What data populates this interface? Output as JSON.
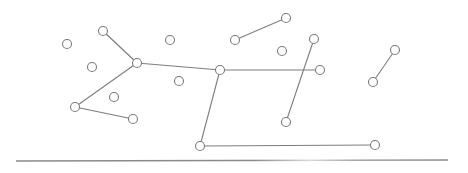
{
  "diagram": {
    "type": "graph",
    "width": 468,
    "height": 173,
    "colors": {
      "background": "#ffffff",
      "edge": "#7d7d7d",
      "node_stroke": "#7a7a7a",
      "node_fill": "#ffffff",
      "baseline": "#8a8a8a"
    },
    "node_radius": 4.5,
    "nodes": [
      {
        "id": "n1",
        "x": 67,
        "y": 44
      },
      {
        "id": "n2",
        "x": 103,
        "y": 31
      },
      {
        "id": "n3",
        "x": 137,
        "y": 63
      },
      {
        "id": "n4",
        "x": 92,
        "y": 67
      },
      {
        "id": "n5",
        "x": 75,
        "y": 107
      },
      {
        "id": "n6",
        "x": 133,
        "y": 119
      },
      {
        "id": "n7",
        "x": 114,
        "y": 97
      },
      {
        "id": "n8",
        "x": 170,
        "y": 40
      },
      {
        "id": "n9",
        "x": 179,
        "y": 81
      },
      {
        "id": "n10",
        "x": 220,
        "y": 70
      },
      {
        "id": "n11",
        "x": 235,
        "y": 40
      },
      {
        "id": "n12",
        "x": 286,
        "y": 18
      },
      {
        "id": "n13",
        "x": 282,
        "y": 51
      },
      {
        "id": "n14",
        "x": 314,
        "y": 39
      },
      {
        "id": "n15",
        "x": 320,
        "y": 70
      },
      {
        "id": "n16",
        "x": 286,
        "y": 122
      },
      {
        "id": "n17",
        "x": 200,
        "y": 146
      },
      {
        "id": "n18",
        "x": 375,
        "y": 145
      },
      {
        "id": "n19",
        "x": 395,
        "y": 50
      },
      {
        "id": "n20",
        "x": 373,
        "y": 82
      }
    ],
    "edges": [
      {
        "from": "n2",
        "to": "n3"
      },
      {
        "from": "n3",
        "to": "n5"
      },
      {
        "from": "n5",
        "to": "n6"
      },
      {
        "from": "n3",
        "to": "n10"
      },
      {
        "from": "n10",
        "to": "n15"
      },
      {
        "from": "n10",
        "to": "n17"
      },
      {
        "from": "n17",
        "to": "n18"
      },
      {
        "from": "n11",
        "to": "n12"
      },
      {
        "from": "n14",
        "to": "n16"
      },
      {
        "from": "n19",
        "to": "n20"
      }
    ],
    "baseline": {
      "x1": 16,
      "y1": 161,
      "x2": 448,
      "y2": 160
    }
  }
}
